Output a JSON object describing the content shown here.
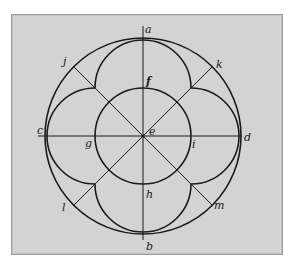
{
  "figure": {
    "background": "#d3d3d3",
    "stroke_color": "#1a1a1a",
    "center": {
      "x": 143,
      "y": 136
    },
    "outer_circle_radius": 98,
    "inner_circle_radius": 48,
    "lobe_radius": 48,
    "labels": {
      "a": "a",
      "b": "b",
      "c": "c",
      "d": "d",
      "e": "e",
      "f": "f",
      "g": "g",
      "h": "h",
      "i": "i",
      "j": "j",
      "k": "k",
      "l": "l",
      "m": "m"
    }
  }
}
